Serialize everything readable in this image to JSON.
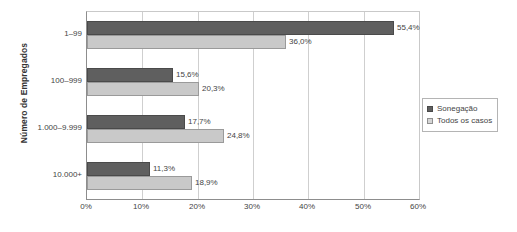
{
  "chart_data": {
    "type": "bar",
    "orientation": "horizontal",
    "title": "",
    "xlabel": "",
    "ylabel": "Número de Empregados",
    "categories": [
      "1–99",
      "100–999",
      "1.000–9.999",
      "10.000+"
    ],
    "xlim": [
      0,
      60
    ],
    "x_ticks": [
      "0%",
      "10%",
      "20%",
      "30%",
      "40%",
      "50%",
      "60%"
    ],
    "x_tick_values": [
      0,
      10,
      20,
      30,
      40,
      50,
      60
    ],
    "grid": "vertical",
    "legend_position": "right",
    "series": [
      {
        "name": "Sonegação",
        "color": "#5f5f5f",
        "values": [
          55.4,
          15.6,
          17.7,
          11.3
        ],
        "labels": [
          "55,4%",
          "15,6%",
          "17,7%",
          "11,3%"
        ]
      },
      {
        "name": "Todos os casos",
        "color": "#c9c9c9",
        "values": [
          36.0,
          20.3,
          24.8,
          18.9
        ],
        "labels": [
          "36,0%",
          "20,3%",
          "24,8%",
          "18,9%"
        ]
      }
    ]
  },
  "legend": {
    "items": [
      {
        "label": "Sonegação",
        "swatch": "dark"
      },
      {
        "label": "Todos os casos",
        "swatch": "light"
      }
    ]
  },
  "colors": {
    "series_dark": "#5f5f5f",
    "series_light": "#c9c9c9",
    "axis": "#8d8d8d",
    "grid": "#cfcfcf",
    "text": "#444444",
    "background": "#ffffff"
  }
}
